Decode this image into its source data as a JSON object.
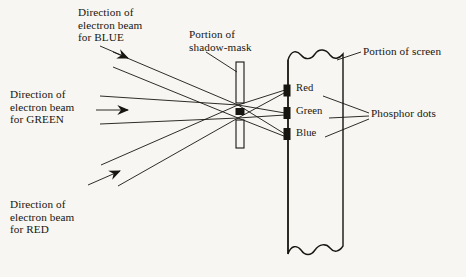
{
  "figure": {
    "background_color": "#f7f6f2",
    "ink_color": "#17150f"
  },
  "labels": {
    "beam_blue": "Direction of\nelectron beam\nfor BLUE",
    "beam_green": "Direction of\nelectron beam\nfor GREEN",
    "beam_red": "Direction of\nelectron beam\nfor RED",
    "shadow_mask": "Portion of\nshadow-mask",
    "screen": "Portion of screen",
    "phosphor_dots": "Phosphor dots",
    "dot_red": "Red",
    "dot_green": "Green",
    "dot_blue": "Blue"
  },
  "parts": {
    "shadow_mask": {
      "name": "shadow-mask",
      "x": 236,
      "top": 62,
      "bottom": 148,
      "width": 8,
      "apertures": [
        105,
        118
      ]
    },
    "screen": {
      "name": "screen",
      "left": 288,
      "right": 343,
      "top": 52,
      "bottom": 253,
      "edge_style": "wavy"
    },
    "phosphor_dots": [
      {
        "label": "Red",
        "x": 285,
        "y": 90,
        "color": "#17150f"
      },
      {
        "label": "Green",
        "x": 285,
        "y": 113,
        "color": "#17150f"
      },
      {
        "label": "Blue",
        "x": 285,
        "y": 134,
        "color": "#17150f"
      }
    ],
    "beams": [
      {
        "name": "blue",
        "origin_y": 40,
        "arrow": true
      },
      {
        "name": "green",
        "origin_y": 105,
        "arrow": true
      },
      {
        "name": "red",
        "origin_y": 215,
        "arrow": true
      }
    ]
  }
}
